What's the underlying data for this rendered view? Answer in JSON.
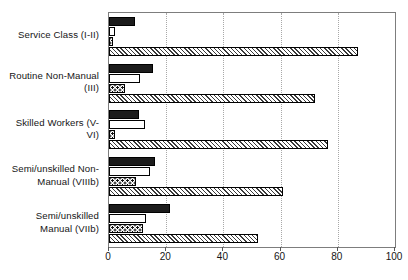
{
  "chart_data": {
    "type": "bar",
    "orientation": "horizontal",
    "title": "",
    "subtitle": "",
    "xlabel": "",
    "ylabel": "",
    "xlim": [
      0,
      100
    ],
    "xticks": [
      0,
      20,
      40,
      60,
      80,
      100
    ],
    "xticklabels": [
      "0",
      "20",
      "40",
      "60",
      "80",
      "100"
    ],
    "grid": true,
    "grid_axis": "x",
    "legend": false,
    "legend_position": "none",
    "categories": [
      "Service Class (I-II)",
      "Routine Non-Manual (III)",
      "Skilled Workers (V-VI)",
      "Semi/unskilled Non-Manual (VIIIb)",
      "Semi/unskilled Manual (VIIb)"
    ],
    "category_lines": [
      [
        "Service Class (I-II)"
      ],
      [
        "Routine Non-Manual",
        "(III)"
      ],
      [
        "Skilled Workers (V-",
        "VI)"
      ],
      [
        "Semi/unskilled Non-",
        "Manual (VIIIb)"
      ],
      [
        "Semi/unskilled",
        "Manual (VIIb)"
      ]
    ],
    "series": [
      {
        "name": "series-1",
        "pattern": "solid-black",
        "color": "#1c1c1c",
        "values": [
          9,
          15.5,
          10.5,
          16,
          21.5
        ]
      },
      {
        "name": "series-2",
        "pattern": "white",
        "color": "#ffffff",
        "values": [
          2,
          11,
          12.5,
          14.5,
          13
        ]
      },
      {
        "name": "series-3",
        "pattern": "dotted",
        "color": "#ffffff",
        "values": [
          1.5,
          5.5,
          2,
          9.5,
          12
        ]
      },
      {
        "name": "series-4",
        "pattern": "hatched",
        "color": "#bdbdbd",
        "values": [
          87,
          72,
          76.5,
          61,
          52
        ]
      }
    ]
  }
}
